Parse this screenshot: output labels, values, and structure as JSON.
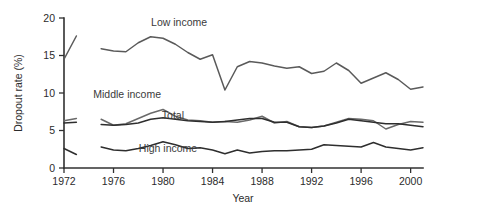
{
  "chart_data": {
    "type": "line",
    "title": "",
    "xlabel": "Year",
    "ylabel": "Dropout rate (%)",
    "xlim": [
      1972,
      2001
    ],
    "ylim": [
      0,
      20
    ],
    "yticks": [
      0,
      5,
      10,
      15,
      20
    ],
    "ytick_labels": [
      "0",
      "5",
      "10",
      "15",
      "20"
    ],
    "xticks": [
      1972,
      1976,
      1980,
      1984,
      1988,
      1992,
      1996,
      2000
    ],
    "xtick_labels": [
      "1972",
      "1976",
      "1980",
      "1984",
      "1988",
      "1992",
      "1996",
      "2000"
    ],
    "grid": false,
    "legend_position": "inline-annotations",
    "series": [
      {
        "name": "Low income",
        "color": "#5a5a5a",
        "label_x": 1981.3,
        "label_y": 19.0,
        "segments": [
          {
            "x": [
              1972,
              1973
            ],
            "values": [
              14.5,
              17.6
            ]
          },
          {
            "x": [
              1975,
              1976,
              1977,
              1978,
              1979,
              1980,
              1981,
              1982,
              1983,
              1984,
              1985,
              1986,
              1987,
              1988,
              1989,
              1990,
              1991,
              1992,
              1993,
              1994,
              1995,
              1996,
              1997,
              1998,
              1999,
              2000,
              2001
            ],
            "values": [
              15.9,
              15.6,
              15.5,
              16.7,
              17.5,
              17.3,
              16.5,
              15.4,
              14.5,
              15.1,
              10.4,
              13.5,
              14.2,
              14.0,
              13.6,
              13.3,
              13.5,
              12.6,
              12.9,
              14.0,
              13.0,
              11.3,
              12.0,
              12.7,
              11.8,
              10.5,
              10.8
            ]
          }
        ]
      },
      {
        "name": "Middle income",
        "color": "#6a6a6a",
        "label_x": 1977.1,
        "label_y": 9.4,
        "segments": [
          {
            "x": [
              1972,
              1973
            ],
            "values": [
              6.3,
              6.6
            ]
          },
          {
            "x": [
              1975,
              1976,
              1977,
              1978,
              1979,
              1980,
              1981,
              1982,
              1983,
              1984,
              1985,
              1986,
              1987,
              1988,
              1989,
              1990,
              1991,
              1992,
              1993,
              1994,
              1995,
              1996,
              1997,
              1998,
              1999,
              2000,
              2001
            ],
            "values": [
              6.5,
              5.7,
              5.9,
              6.6,
              7.3,
              7.8,
              6.9,
              6.4,
              6.3,
              6.1,
              6.2,
              6.1,
              6.4,
              6.9,
              6.0,
              6.2,
              5.5,
              5.4,
              5.6,
              6.1,
              6.6,
              6.5,
              6.3,
              5.2,
              5.8,
              6.2,
              6.1
            ]
          }
        ]
      },
      {
        "name": "Total",
        "color": "#2e2e2e",
        "label_x": 1980.8,
        "label_y": 6.5,
        "segments": [
          {
            "x": [
              1972,
              1973
            ],
            "values": [
              6.0,
              6.1
            ]
          },
          {
            "x": [
              1975,
              1976,
              1977,
              1978,
              1979,
              1980,
              1981,
              1982,
              1983,
              1984,
              1985,
              1986,
              1987,
              1988,
              1989,
              1990,
              1991,
              1992,
              1993,
              1994,
              1995,
              1996,
              1997,
              1998,
              1999,
              2000,
              2001
            ],
            "values": [
              5.8,
              5.7,
              5.8,
              6.0,
              6.5,
              6.7,
              6.5,
              6.3,
              6.2,
              6.1,
              6.2,
              6.4,
              6.6,
              6.6,
              6.1,
              6.1,
              5.5,
              5.4,
              5.6,
              6.0,
              6.5,
              6.3,
              6.1,
              5.9,
              5.9,
              5.7,
              5.5
            ]
          }
        ]
      },
      {
        "name": "High income",
        "color": "#2e2e2e",
        "label_x": 1980.4,
        "label_y": 2.1,
        "segments": [
          {
            "x": [
              1972,
              1973
            ],
            "values": [
              2.6,
              1.8
            ]
          },
          {
            "x": [
              1975,
              1976,
              1977,
              1978,
              1979,
              1980,
              1981,
              1982,
              1983,
              1984,
              1985,
              1986,
              1987,
              1988,
              1989,
              1990,
              1991,
              1992,
              1993,
              1994,
              1995,
              1996,
              1997,
              1998,
              1999,
              2000,
              2001
            ],
            "values": [
              2.8,
              2.4,
              2.3,
              2.6,
              3.0,
              3.5,
              3.1,
              2.6,
              2.7,
              2.4,
              1.9,
              2.4,
              2.0,
              2.2,
              2.3,
              2.3,
              2.4,
              2.5,
              3.1,
              3.0,
              2.9,
              2.8,
              3.4,
              2.8,
              2.6,
              2.4,
              2.7
            ]
          }
        ]
      }
    ]
  }
}
